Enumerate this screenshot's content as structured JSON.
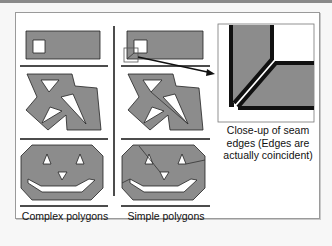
{
  "figure": {
    "columns": [
      {
        "id": "complex",
        "label": "Complex polygons"
      },
      {
        "id": "simple",
        "label": "Simple polygons"
      }
    ],
    "closeup": {
      "caption_line1": "Close-up of seam",
      "caption_line2": "edges  (Edges are",
      "caption_line3": "actually coincident)"
    },
    "colors": {
      "fill": "#8c8c8c",
      "stroke": "#111111",
      "background": "#ffffff",
      "frame": "#9a9a9a"
    }
  }
}
